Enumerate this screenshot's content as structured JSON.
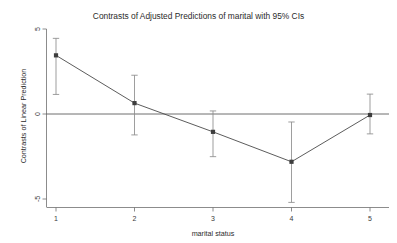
{
  "chart_data": {
    "type": "line",
    "title": "Contrasts of Adjusted Predictions of marital with 95% CIs",
    "xlabel": "marital status",
    "ylabel": "Contrasts of Linear Prediction",
    "categories": [
      "1",
      "2",
      "3",
      "4",
      "5"
    ],
    "x": [
      1,
      2,
      3,
      4,
      5
    ],
    "values": [
      3.45,
      0.64,
      -1.05,
      -2.81,
      -0.06
    ],
    "ci_lower": [
      1.15,
      -1.23,
      -2.51,
      -5.2,
      -1.17
    ],
    "ci_upper": [
      4.45,
      2.28,
      0.18,
      -0.47,
      1.17
    ],
    "series": [
      {
        "name": "Contrasts of Linear Prediction",
        "values": [
          3.45,
          0.64,
          -1.05,
          -2.81,
          -0.06
        ]
      }
    ],
    "xlim": [
      0.72,
      5.3
    ],
    "ylim": [
      -5.8,
      5.6
    ],
    "ytick_labels": [
      "5",
      "0",
      "-5"
    ],
    "ytick_values": [
      5,
      0,
      -5
    ],
    "xtick_labels": [
      "1",
      "2",
      "3",
      "4",
      "5"
    ],
    "xtick_values": [
      1,
      2,
      3,
      4,
      5
    ],
    "grid": false,
    "legend": false,
    "reference_line_y": 0,
    "marker": "square",
    "error_bars": "95% CI",
    "colors": {
      "line": "#4a4a4a",
      "marker": "#3d3d3d",
      "whisker": "#8c8c8c",
      "axis": "#6f6f6f",
      "text": "#2b2b2b",
      "background": "#ffffff"
    }
  }
}
